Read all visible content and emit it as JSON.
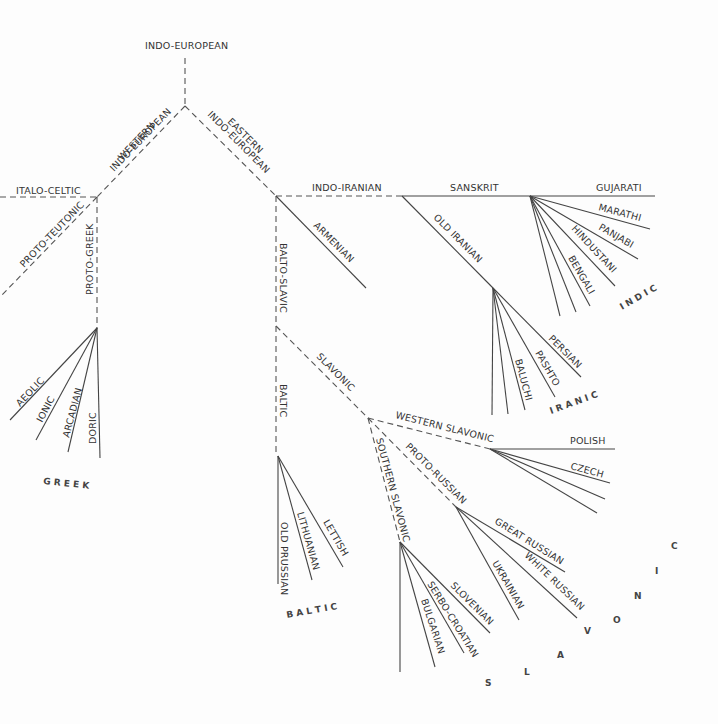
{
  "diagram": {
    "title": "INDO-EUROPEAN",
    "type": "language family tree",
    "nodes": {
      "root": "INDO-EUROPEAN",
      "western": "WESTERN INDO-EUROPEAN",
      "eastern": "EASTERN INDO-EUROPEAN",
      "italo_celtic": "ITALO-CELTIC",
      "proto_teutonic": "PROTO-TEUTONIC",
      "proto_greek": "PROTO-GREEK",
      "indo_iranian": "INDO-IRANIAN",
      "sanskrit": "SANSKRIT",
      "old_iranian": "OLD IRANIAN",
      "armenian": "ARMENIAN",
      "balto_slavic": "BALTO-SLAVIC",
      "baltic": "BALTIC",
      "slavonic": "SLAVONIC",
      "western_slavonic": "WESTERN SLAVONIC",
      "southern_slavonic": "SOUTHERN SLAVONIC",
      "proto_russian": "PROTO-RUSSIAN"
    },
    "groups": [
      {
        "name": "GREEK",
        "members": [
          "AEOLIC",
          "IONIC",
          "ARCADIAN",
          "DORIC"
        ]
      },
      {
        "name": "INDIC",
        "members": [
          "GUJARATI",
          "MARATHI",
          "PANJABI",
          "HINDUSTANI",
          "BENGALI"
        ]
      },
      {
        "name": "IRANIC",
        "members": [
          "PERSIAN",
          "PASHTO",
          "BALUCHI"
        ]
      },
      {
        "name": "BALTIC",
        "members": [
          "OLD PRUSSIAN",
          "LITHUANIAN",
          "LETTISH"
        ]
      },
      {
        "name": "SLAVONIC",
        "members": [
          "POLISH",
          "CZECH",
          "GREAT RUSSIAN",
          "WHITE RUSSIAN",
          "UKRAINIAN",
          "SLOVENIAN",
          "SERBO-CROATIAN",
          "BULGARIAN"
        ]
      }
    ],
    "labels": {
      "root": "INDO-EUROPEAN",
      "western_1": "WESTERN",
      "western_2": "INDO-EUROPEAN",
      "eastern_1": "EASTERN",
      "eastern_2": "INDO-EUROPEAN",
      "italo_celtic": "ITALO-CELTIC",
      "proto_teutonic": "PROTO-TEUTONIC",
      "proto_greek": "PROTO-GREEK",
      "aeolic": "AEOLIC",
      "ionic": "IONIC",
      "arcadian": "ARCADIAN",
      "doric": "DORIC",
      "greek_group": "G R E E K",
      "indo_iranian": "INDO-IRANIAN",
      "sanskrit": "SANSKRIT",
      "gujarati": "GUJARATI",
      "marathi": "MARATHI",
      "panjabi": "PANJABI",
      "hindustani": "HINDUSTANI",
      "bengali": "BENGALI",
      "indic_group": "I N D I C",
      "old_iranian": "OLD IRANIAN",
      "persian": "PERSIAN",
      "pashto": "PASHTO",
      "baluchi": "BALUCHI",
      "iranic_group": "I R A N I C",
      "armenian": "ARMENIAN",
      "balto_slavic": "BALTO-SLAVIC",
      "baltic": "BALTIC",
      "old_prussian": "OLD PRUSSIAN",
      "lithuanian": "LITHUANIAN",
      "lettish": "LETTISH",
      "baltic_group": "B A L T I C",
      "slavonic": "SLAVONIC",
      "western_slavonic": "WESTERN SLAVONIC",
      "polish": "POLISH",
      "czech": "CZECH",
      "southern_slavonic": "SOUTHERN SLAVONIC",
      "proto_russian": "PROTO-RUSSIAN",
      "great_russian": "GREAT RUSSIAN",
      "white_russian": "WHITE RUSSIAN",
      "ukrainian": "UKRAINIAN",
      "slovenian": "SLOVENIAN",
      "serbo_croatian": "SERBO-CROATIAN",
      "bulgarian": "BULGARIAN",
      "slavonic_group_s": "S",
      "slavonic_group_l": "L",
      "slavonic_group_a": "A",
      "slavonic_group_v": "V",
      "slavonic_group_o": "O",
      "slavonic_group_n": "N",
      "slavonic_group_i": "I",
      "slavonic_group_c": "C"
    },
    "colors": {
      "line": "#444444",
      "text": "#333333",
      "background": "#fdfdfd"
    }
  }
}
